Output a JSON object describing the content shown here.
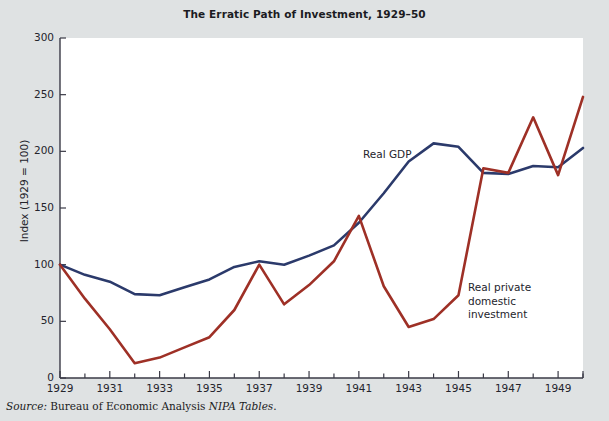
{
  "chart_data": {
    "type": "line",
    "title": "The Erratic Path of Investment, 1929–50",
    "xlabel": "",
    "ylabel": "Index (1929 = 100)",
    "xlim": [
      1929,
      1950
    ],
    "ylim": [
      0,
      300
    ],
    "grid": false,
    "legend_position": "inline-annotation",
    "x": [
      1929,
      1930,
      1931,
      1932,
      1933,
      1934,
      1935,
      1936,
      1937,
      1938,
      1939,
      1940,
      1941,
      1942,
      1943,
      1944,
      1945,
      1946,
      1947,
      1948,
      1949,
      1950
    ],
    "xticks": [
      1929,
      1931,
      1933,
      1935,
      1937,
      1939,
      1941,
      1943,
      1945,
      1947,
      1949
    ],
    "xtick_labels": [
      "1929",
      "1931",
      "1933",
      "1935",
      "1937",
      "1939",
      "1941",
      "1943",
      "1945",
      "1947",
      "1949"
    ],
    "yticks": [
      0,
      50,
      100,
      150,
      200,
      250,
      300
    ],
    "ytick_labels": [
      "0",
      "50",
      "100",
      "150",
      "200",
      "250",
      "300"
    ],
    "series": [
      {
        "name": "Real GDP",
        "color": "#2b3a6b",
        "label_text": "Real GDP",
        "values": [
          100,
          91,
          85,
          74,
          73,
          80,
          87,
          98,
          103,
          100,
          108,
          117,
          137,
          163,
          191,
          207,
          204,
          181,
          180,
          187,
          186,
          203
        ]
      },
      {
        "name": "Real private domestic investment",
        "color": "#9e3026",
        "label_text": "Real private\ndomestic\ninvestment",
        "values": [
          100,
          70,
          43,
          13,
          18,
          27,
          36,
          60,
          100,
          65,
          82,
          103,
          143,
          81,
          45,
          52,
          73,
          185,
          181,
          230,
          179,
          248
        ]
      }
    ],
    "source": {
      "prefix": "Source:",
      "text": "Bureau of Economic Analysis",
      "italic_tail": "NIPA Tables",
      "suffix": "."
    }
  }
}
